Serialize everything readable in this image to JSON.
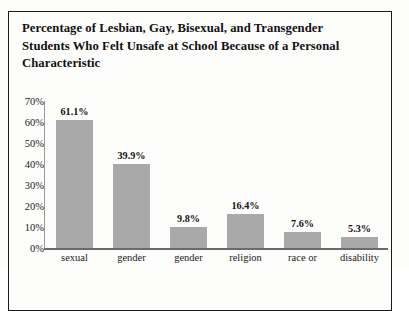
{
  "chart_data": {
    "type": "bar",
    "title": "Percentage of Lesbian, Gay, Bisexual, and Transgender Students Who Felt Unsafe at School Because of a Personal Characteristic",
    "xlabel": "",
    "ylabel": "",
    "categories": [
      "sexual",
      "gender",
      "gender",
      "religion",
      "race or",
      "disability"
    ],
    "values": [
      61.1,
      39.9,
      9.8,
      16.4,
      7.6,
      5.3
    ],
    "value_labels": [
      "61.1%",
      "39.9%",
      "9.8%",
      "16.4%",
      "7.6%",
      "5.3%"
    ],
    "ylim": [
      0,
      70
    ],
    "yticks": [
      0,
      10,
      20,
      30,
      40,
      50,
      60,
      70
    ],
    "ytick_labels": [
      "0%",
      "10%",
      "20%",
      "30%",
      "40%",
      "50%",
      "60%",
      "70%"
    ],
    "grid": false,
    "legend": "none",
    "bar_color": "#a9a9a9",
    "axis_color": "#6b6b6b",
    "text_color": "#111111",
    "background": "#fdfdfc",
    "frame_color": "#1a1a1a"
  }
}
